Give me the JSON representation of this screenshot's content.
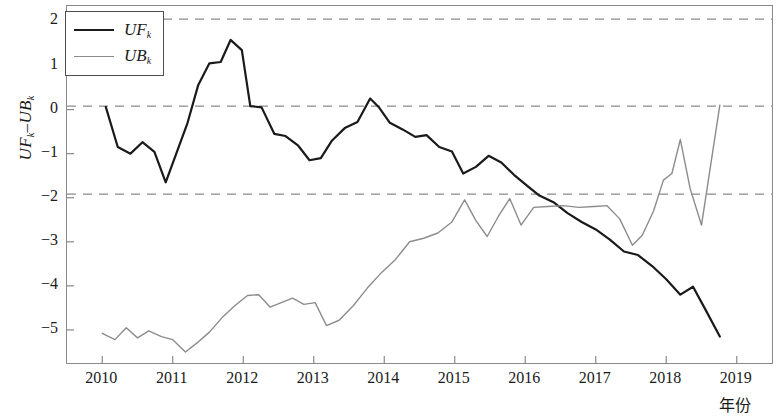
{
  "chart_data": {
    "type": "line",
    "title": "",
    "xlabel": "年份",
    "ylabel": "UFₖ–UBₖ",
    "ylabel_main": "UF",
    "ylabel_sub1": "k",
    "ylabel_mid": "–UB",
    "ylabel_sub2": "k",
    "xlim": [
      2009.5,
      2019.5
    ],
    "ylim": [
      -5.75,
      2.35
    ],
    "yticks": [
      2,
      1,
      0,
      -1,
      -2,
      -3,
      -4,
      -5
    ],
    "ytick_labels": [
      "2",
      "1",
      "0",
      "−1",
      "−2",
      "−3",
      "−4",
      "−5"
    ],
    "xticks": [
      2010,
      2011,
      2012,
      2013,
      2014,
      2015,
      2016,
      2017,
      2018,
      2019
    ],
    "xtick_labels": [
      "2010",
      "2011",
      "2012",
      "2013",
      "2014",
      "2015",
      "2016",
      "2017",
      "2018",
      "2019"
    ],
    "grid": false,
    "legend_position": "top-left",
    "reference_lines": [
      {
        "name": "upper-critical",
        "value": 2.05,
        "style": "dashed",
        "color": "#8c8c8c"
      },
      {
        "name": "zero-line",
        "value": 0.08,
        "style": "dashed",
        "color": "#8c8c8c"
      },
      {
        "name": "lower-critical",
        "value": -1.92,
        "style": "dashed",
        "color": "#8c8c8c"
      }
    ],
    "series": [
      {
        "name": "UFₖ",
        "legend_label": "UF",
        "legend_sub": "k",
        "color": "#1a1a1a",
        "width": 2.2,
        "x": [
          2010.05,
          2010.22,
          2010.4,
          2010.57,
          2010.74,
          2010.9,
          2011.05,
          2011.21,
          2011.36,
          2011.52,
          2011.68,
          2011.82,
          2011.98,
          2012.1,
          2012.26,
          2012.44,
          2012.6,
          2012.78,
          2012.94,
          2013.1,
          2013.26,
          2013.44,
          2013.62,
          2013.8,
          2013.92,
          2014.08,
          2014.26,
          2014.44,
          2014.6,
          2014.78,
          2014.96,
          2015.12,
          2015.3,
          2015.48,
          2015.66,
          2015.84,
          2016.02,
          2016.2,
          2016.4,
          2016.6,
          2016.8,
          2017.0,
          2017.2,
          2017.4,
          2017.6,
          2017.8,
          2018.0,
          2018.2,
          2018.38,
          2018.56,
          2018.76
        ],
        "y": [
          0.06,
          -0.85,
          -1.0,
          -0.74,
          -0.96,
          -1.65,
          -1.0,
          -0.3,
          0.55,
          1.05,
          1.08,
          1.58,
          1.35,
          0.08,
          0.05,
          -0.55,
          -0.6,
          -0.82,
          -1.15,
          -1.1,
          -0.7,
          -0.42,
          -0.28,
          0.25,
          0.06,
          -0.3,
          -0.45,
          -0.62,
          -0.58,
          -0.85,
          -0.95,
          -1.45,
          -1.3,
          -1.05,
          -1.2,
          -1.48,
          -1.72,
          -1.95,
          -2.1,
          -2.35,
          -2.55,
          -2.72,
          -2.95,
          -3.22,
          -3.3,
          -3.55,
          -3.85,
          -4.2,
          -4.02,
          -4.55,
          -5.15
        ]
      },
      {
        "name": "UBₖ",
        "legend_label": "UB",
        "legend_sub": "k",
        "color": "#8c8c8c",
        "width": 1.4,
        "x": [
          2010.0,
          2010.18,
          2010.34,
          2010.5,
          2010.66,
          2010.84,
          2011.0,
          2011.18,
          2011.34,
          2011.52,
          2011.7,
          2011.88,
          2012.06,
          2012.22,
          2012.38,
          2012.54,
          2012.7,
          2012.86,
          2013.02,
          2013.18,
          2013.36,
          2013.56,
          2013.76,
          2013.96,
          2014.16,
          2014.36,
          2014.56,
          2014.76,
          2014.96,
          2015.14,
          2015.3,
          2015.46,
          2015.62,
          2015.78,
          2015.94,
          2016.12,
          2016.32,
          2016.54,
          2016.76,
          2016.98,
          2017.16,
          2017.34,
          2017.52,
          2017.66,
          2017.82,
          2017.96,
          2018.08,
          2018.2,
          2018.34,
          2018.5,
          2018.76
        ],
        "y": [
          -5.08,
          -5.22,
          -4.95,
          -5.18,
          -5.02,
          -5.15,
          -5.22,
          -5.5,
          -5.3,
          -5.05,
          -4.72,
          -4.45,
          -4.22,
          -4.2,
          -4.48,
          -4.38,
          -4.28,
          -4.42,
          -4.38,
          -4.9,
          -4.78,
          -4.45,
          -4.05,
          -3.7,
          -3.4,
          -3.0,
          -2.92,
          -2.8,
          -2.55,
          -2.05,
          -2.52,
          -2.88,
          -2.42,
          -2.02,
          -2.62,
          -2.22,
          -2.2,
          -2.18,
          -2.22,
          -2.2,
          -2.18,
          -2.48,
          -3.08,
          -2.85,
          -2.3,
          -1.6,
          -1.45,
          -0.68,
          -1.8,
          -2.62,
          0.1
        ]
      }
    ]
  },
  "legend": {
    "items": [
      {
        "label": "UF",
        "sub": "k"
      },
      {
        "label": "UB",
        "sub": "k"
      }
    ]
  }
}
